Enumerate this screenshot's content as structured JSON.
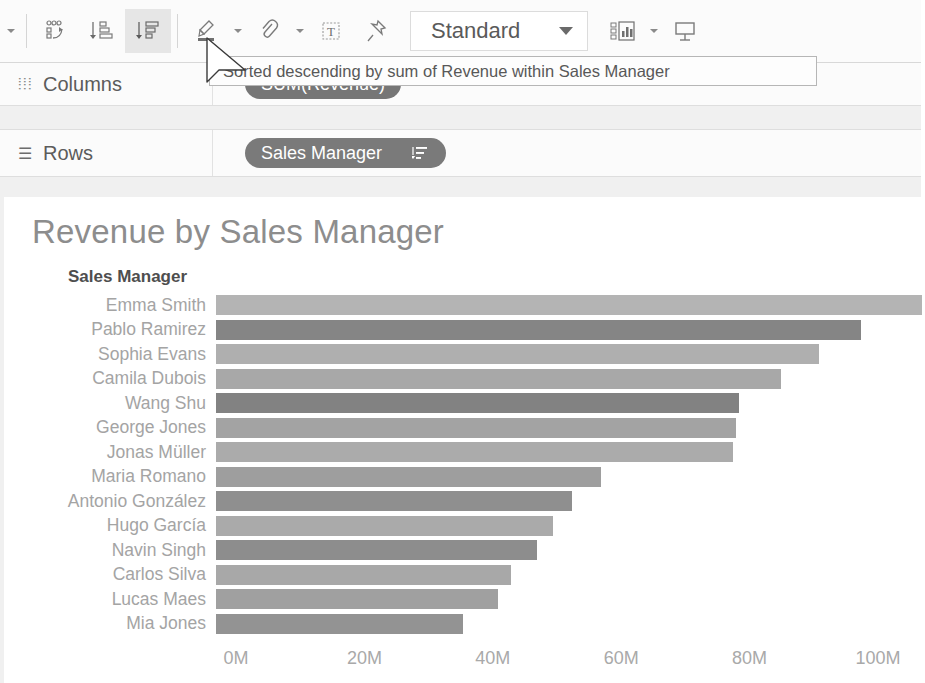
{
  "toolbar": {
    "buttons": [
      {
        "name": "undo-redo-caret",
        "icon": "caret-down-icon",
        "label": ""
      },
      {
        "name": "swap-rows-columns-button",
        "icon": "swap-rows-columns-icon",
        "label": ""
      },
      {
        "name": "sort-ascending-button",
        "icon": "sort-ascending-icon",
        "label": ""
      },
      {
        "name": "sort-descending-button",
        "icon": "sort-descending-icon",
        "label": "",
        "active": true
      },
      {
        "name": "highlighter-button",
        "icon": "highlighter-icon",
        "label": ""
      },
      {
        "name": "group-members-button",
        "icon": "paperclip-group-icon",
        "label": ""
      },
      {
        "name": "show-mark-labels-button",
        "icon": "text-label-icon",
        "label": ""
      },
      {
        "name": "fix-axes-button",
        "icon": "pushpin-icon",
        "label": ""
      },
      {
        "name": "show-me-button",
        "icon": "show-me-chart-icon",
        "label": ""
      },
      {
        "name": "presentation-mode-button",
        "icon": "presentation-icon",
        "label": ""
      }
    ],
    "fit_selector": {
      "value": "Standard",
      "caret": "caret-down-icon"
    }
  },
  "tooltip": {
    "text": "Sorted descending by sum of Revenue within Sales Manager"
  },
  "shelves": [
    {
      "name": "columns",
      "label": "Columns",
      "icon": "columns-grid-icon",
      "pill": {
        "label": "SUM(Revenue)",
        "sort_icon": ""
      }
    },
    {
      "name": "rows",
      "label": "Rows",
      "icon": "rows-list-icon",
      "pill": {
        "label": "Sales Manager",
        "sort_icon": "sort-descending-icon"
      }
    }
  ],
  "viz": {
    "title": "Revenue by Sales Manager",
    "field_header": "Sales Manager"
  },
  "chart_data": {
    "type": "bar",
    "orientation": "horizontal",
    "title": "Revenue by Sales Manager",
    "xlabel": "",
    "ylabel": "Sales Manager",
    "xlim": [
      0,
      110
    ],
    "xtick_labels": [
      "0M",
      "20M",
      "40M",
      "60M",
      "80M",
      "100M"
    ],
    "xticks": [
      0,
      20,
      40,
      60,
      80,
      100
    ],
    "grid": false,
    "legend": null,
    "sort": "descending by sum of Revenue",
    "unit": "M",
    "categories": [
      "Emma Smith",
      "Pablo Ramirez",
      "Sophia Evans",
      "Camila Dubois",
      "Wang Shu",
      "George Jones",
      "Jonas Müller",
      "Maria Romano",
      "Antonio González",
      "Hugo García",
      "Navin Singh",
      "Carlos Silva",
      "Lucas Maes",
      "Mia Jones"
    ],
    "values": [
      110,
      100.5,
      94,
      88,
      81.5,
      81,
      80.5,
      60,
      55.5,
      52.5,
      50,
      46,
      44,
      38.5
    ],
    "bar_colors": [
      "#b4b4b4",
      "#858585",
      "#afafaf",
      "#a8a8a8",
      "#828282",
      "#a3a3a3",
      "#ababab",
      "#9e9e9e",
      "#8f8f8f",
      "#aaaaaa",
      "#8d8d8d",
      "#a8a8a8",
      "#a0a0a0",
      "#939393"
    ]
  }
}
